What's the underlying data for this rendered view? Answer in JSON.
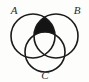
{
  "figure": {
    "type": "venn-diagram",
    "background_color": "#fdfdfb",
    "stroke_color": "#1b1b1b",
    "shade_color": "#141414",
    "label_color": "#2a2a2a",
    "width": 89,
    "height": 82
  },
  "sets": [
    {
      "id": "A",
      "label": "A",
      "position": "top-left",
      "center_x": 33,
      "center_y": 36,
      "radius": 22,
      "label_x": 14,
      "label_y": 11
    },
    {
      "id": "B",
      "label": "B",
      "position": "top-right",
      "center_x": 56,
      "center_y": 36,
      "radius": 22,
      "label_x": 77,
      "label_y": 11
    },
    {
      "id": "C",
      "label": "C",
      "position": "bottom-center",
      "center_x": 45,
      "center_y": 52,
      "radius": 20,
      "label_x": 45,
      "label_y": 76
    }
  ],
  "shaded": {
    "name": "a-intersect-b-minus-c",
    "description": "Region inside A and B but outside C",
    "included_sets": [
      "A",
      "B"
    ],
    "excluded_sets": [
      "C"
    ],
    "fill": "#141414"
  }
}
